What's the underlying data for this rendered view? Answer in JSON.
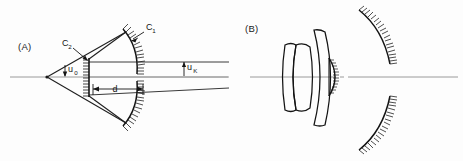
{
  "figure": {
    "background_color": "#fdfdfd",
    "ink_color": "#141414",
    "axis_color": "#8f8f8f",
    "ray_color": "#2b2b2b"
  },
  "panels": [
    {
      "id": "A",
      "label": "(A)",
      "label_x": 18,
      "label_y": 48,
      "description": "Two-mirror Cassegrain-type ray diagram",
      "optical_axis": {
        "x1": 10,
        "y1": 77,
        "x2": 228,
        "y2": 77
      },
      "vertex": {
        "x": 47,
        "y": 77
      },
      "elements": [
        {
          "name": "primary-mirror-upper",
          "label": "C1",
          "label_text": "C",
          "label_sub": "1",
          "label_x": 146,
          "label_y": 30,
          "arrow_from_x": 142,
          "arrow_from_y": 33,
          "arrow_to_x": 131,
          "arrow_to_y": 40,
          "arc_path": "M 124,30 Q 137,46 136,73",
          "hatch_side": "outer",
          "hatch_count": 17,
          "hatch_len": 6
        },
        {
          "name": "primary-mirror-lower",
          "arc_path": "M 124,125 Q 137,109 136,83",
          "hatch_side": "outer",
          "hatch_count": 17,
          "hatch_len": 6
        },
        {
          "name": "secondary-mirror",
          "label": "C2",
          "label_text": "C",
          "label_sub": "2",
          "label_x": 62,
          "label_y": 46,
          "arrow_from_x": 72,
          "arrow_from_y": 48,
          "arrow_to_x": 87,
          "arrow_to_y": 62,
          "line_x": 89,
          "line_y1": 59,
          "line_y2": 96,
          "hatch_side": "left",
          "hatch_count": 12,
          "hatch_len": 6
        }
      ],
      "angles": [
        {
          "name": "u0",
          "text": "u",
          "sub": "0",
          "x": 68,
          "y": 72,
          "tick_x": 65,
          "tick_y1": 66,
          "tick_y2": 76
        },
        {
          "name": "uK",
          "text": "u",
          "sub": "K",
          "x": 187,
          "y": 70,
          "tick_x": 184,
          "tick_y1": 63,
          "tick_y2": 75
        }
      ],
      "dimensions": [
        {
          "name": "d",
          "text": "d",
          "x": 117,
          "y": 93,
          "line_x1": 93,
          "line_x2": 143,
          "line_y": 89
        }
      ],
      "rays": [
        {
          "name": "ray-upper-converging",
          "x1": 47,
          "y1": 77,
          "x2": 125,
          "y2": 33
        },
        {
          "name": "ray-lower-converging",
          "x1": 47,
          "y1": 77,
          "x2": 125,
          "y2": 122
        },
        {
          "name": "ray-upper-return",
          "x1": 125,
          "y1": 33,
          "x2": 89,
          "y2": 60
        },
        {
          "name": "ray-lower-return",
          "x1": 125,
          "y1": 122,
          "x2": 89,
          "y2": 96
        },
        {
          "name": "ray-parallel-top",
          "x1": 89,
          "y1": 62,
          "x2": 229,
          "y2": 62
        },
        {
          "name": "ray-parallel-mid",
          "x1": 89,
          "y1": 77,
          "x2": 229,
          "y2": 77
        },
        {
          "name": "ray-parallel-bottom",
          "x1": 89,
          "y1": 95,
          "x2": 229,
          "y2": 88
        }
      ]
    },
    {
      "id": "B",
      "label": "(B)",
      "label_x": 245,
      "label_y": 30,
      "description": "Catadioptric lens and mirror assembly",
      "optical_axis": {
        "x1": 250,
        "y1": 77,
        "x2": 458,
        "y2": 77
      },
      "lenses": [
        {
          "name": "lens-doublet-front",
          "path": "M 285,44 Q 281,77 285,110 Q 292,113 297,110 Q 291,77 297,44 Q 292,41 285,44 Z"
        },
        {
          "name": "lens-doublet-rear",
          "path": "M 297,44 Q 291,77 297,110 Q 305,113 311,108 Q 316,77 311,46 Q 305,41 297,44 Z"
        },
        {
          "name": "lens-meniscus",
          "path": "M 313,29 Q 325,77 313,126 Q 320,128 325,126 Q 336,77 325,31 Q 320,28 313,29 Z"
        }
      ],
      "mirrors": [
        {
          "name": "secondary-mirror-small",
          "arc_path": "M 329,59 Q 340,77 329,95",
          "back_path": "M 329,59 L 329,95",
          "hatch_side": "right",
          "hatch_count": 13,
          "hatch_len": 4
        },
        {
          "name": "primary-mirror-upper-arc",
          "arc_path": "M 360,10 Q 383,30 390,63",
          "hatch_side": "upper-left",
          "hatch_count": 20,
          "hatch_len": 6
        },
        {
          "name": "primary-mirror-lower-arc",
          "arc_path": "M 360,150 Q 383,130 390,95",
          "hatch_side": "lower-left",
          "hatch_count": 20,
          "hatch_len": 6
        }
      ]
    }
  ]
}
